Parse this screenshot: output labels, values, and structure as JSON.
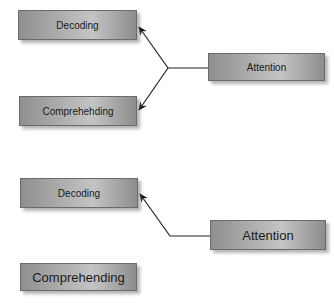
{
  "diagram": {
    "top": {
      "decoding": "Decoding",
      "comprehending": "Comprehehding",
      "attention": "Attention"
    },
    "bottom": {
      "decoding": "Decoding",
      "comprehending": "Comprehending",
      "attention": "Attention"
    },
    "colors": {
      "box_border": "#6b6b6b",
      "box_fill": "#a9a9a9",
      "line": "#222222",
      "text": "#1a1a1a"
    }
  }
}
